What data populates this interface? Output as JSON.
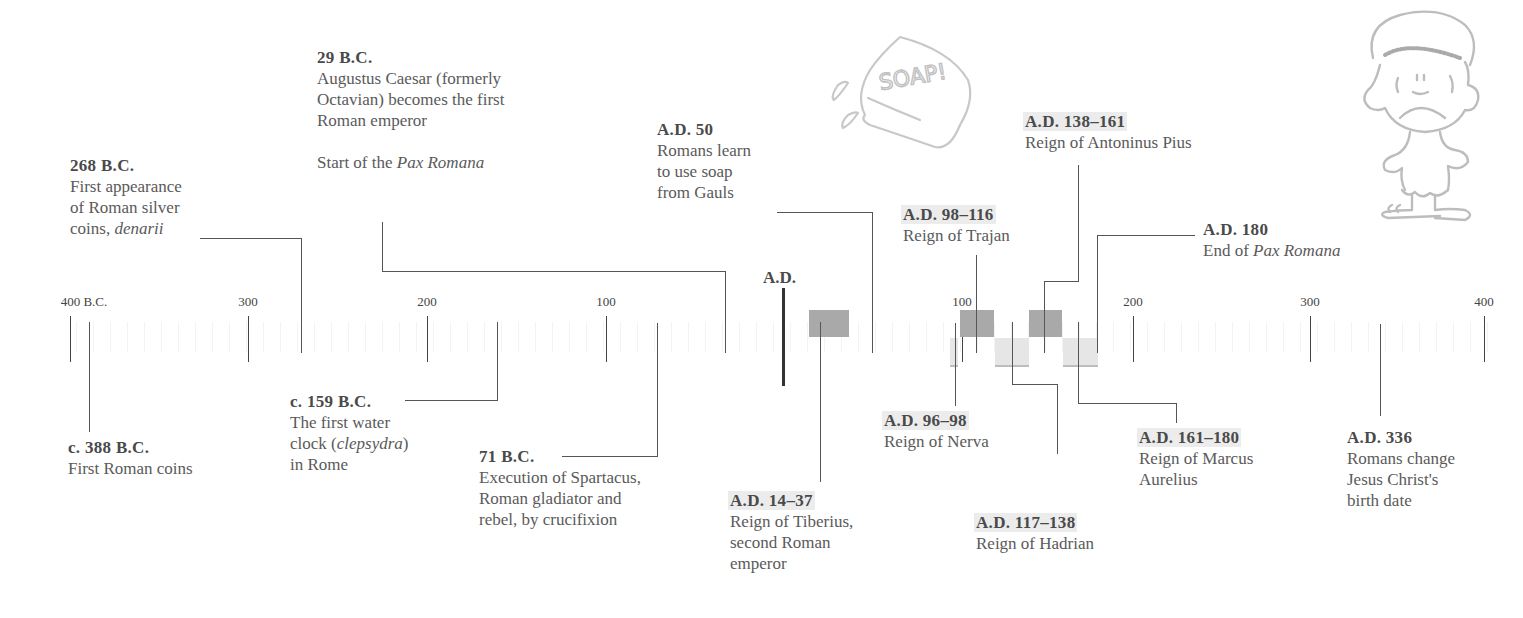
{
  "axis": {
    "ticks": [
      {
        "label": "400 B.C.",
        "x": 70
      },
      {
        "label": "300",
        "x": 248
      },
      {
        "label": "200",
        "x": 427
      },
      {
        "label": "100",
        "x": 606
      },
      {
        "label": "100",
        "x": 962
      },
      {
        "label": "200",
        "x": 1133
      },
      {
        "label": "300",
        "x": 1310
      },
      {
        "label": "400",
        "x": 1484
      }
    ],
    "era_marker": "A.D."
  },
  "events": [
    {
      "id": "e388bc",
      "date": "c. 388 B.C.",
      "lines": [
        "First Roman coins"
      ]
    },
    {
      "id": "e268bc",
      "date": "268 B.C.",
      "lines": [
        "First appearance",
        "of Roman silver",
        "coins, "
      ],
      "italic_tail": "denarii"
    },
    {
      "id": "e159bc",
      "date": "c. 159 B.C.",
      "lines": [
        "The first water",
        "clock (",
        "in Rome"
      ],
      "italic_word": "clepsydra",
      "after_italic": ")"
    },
    {
      "id": "e71bc",
      "date": "71 B.C.",
      "lines": [
        "Execution of Spartacus,",
        "Roman gladiator and",
        "rebel, by crucifixion"
      ]
    },
    {
      "id": "e29bc",
      "date": "29 B.C.",
      "lines": [
        "Augustus Caesar (formerly",
        "Octavian) becomes the first",
        "Roman emperor"
      ],
      "extra_prefix": "Start of the ",
      "extra_italic": "Pax Romana"
    },
    {
      "id": "ead14",
      "date": "A.D. 14–37",
      "lines": [
        "Reign of Tiberius,",
        "second Roman",
        "emperor"
      ]
    },
    {
      "id": "ead50",
      "date": "A.D. 50",
      "lines": [
        "Romans learn",
        "to use soap",
        "from Gauls"
      ]
    },
    {
      "id": "ead96",
      "date": "A.D. 96–98",
      "lines": [
        "Reign of Nerva"
      ]
    },
    {
      "id": "ead98",
      "date": "A.D. 98–116",
      "lines": [
        "Reign of Trajan"
      ]
    },
    {
      "id": "ead117",
      "date": "A.D. 117–138",
      "lines": [
        "Reign of Hadrian"
      ]
    },
    {
      "id": "ead138",
      "date": "A.D. 138–161",
      "lines": [
        "Reign of Antoninus Pius"
      ]
    },
    {
      "id": "ead161",
      "date": "A.D. 161–180",
      "lines": [
        "Reign of Marcus",
        "Aurelius"
      ]
    },
    {
      "id": "ead180",
      "date": "A.D. 180",
      "prefix": "End of ",
      "italic": "Pax Romana"
    },
    {
      "id": "ead336",
      "date": "A.D. 336",
      "lines": [
        "Romans change",
        "Jesus Christ's",
        "birth date"
      ]
    }
  ],
  "illustrations": {
    "soap_text": "SOAP!",
    "soap_label": "soap-bar-doodle",
    "boy_label": "sad-roman-boy-doodle"
  },
  "colors": {
    "reign_dark": "#a9a9a9",
    "reign_light": "#e6e6e6",
    "date_highlight": "#ececec",
    "text": "#5a5a5a",
    "lines": "#555555"
  }
}
